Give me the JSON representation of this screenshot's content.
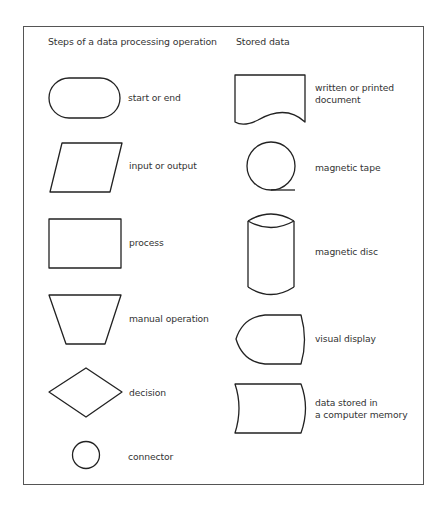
{
  "diagram": {
    "columns": [
      {
        "heading": "Steps of a data processing operation",
        "items": [
          {
            "shape": "rounded-terminal",
            "label": "start or end"
          },
          {
            "shape": "parallelogram",
            "label": "input or output"
          },
          {
            "shape": "rectangle",
            "label": "process"
          },
          {
            "shape": "trapezoid",
            "label": "manual operation"
          },
          {
            "shape": "diamond",
            "label": "decision"
          },
          {
            "shape": "circle",
            "label": "connector"
          }
        ]
      },
      {
        "heading": "Stored data",
        "items": [
          {
            "shape": "document",
            "label_lines": [
              "written or printed",
              "document"
            ]
          },
          {
            "shape": "magnetic-tape",
            "label": "magnetic tape"
          },
          {
            "shape": "cylinder",
            "label": "magnetic disc"
          },
          {
            "shape": "display",
            "label": "visual display"
          },
          {
            "shape": "stored-data",
            "label_lines": [
              "data stored in",
              "a computer memory"
            ]
          }
        ]
      }
    ],
    "colors": {
      "stroke": "#222222",
      "border": "#555555",
      "text": "#333333",
      "background": "#ffffff"
    }
  }
}
